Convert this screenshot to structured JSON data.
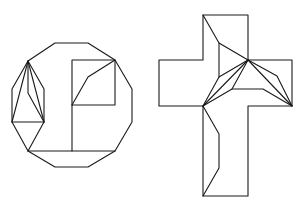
{
  "figure": {
    "background": "#ffffff",
    "stroke_color": "#1a1a1a",
    "shapes": [
      {
        "name": "dodecagon-dissection",
        "outline": [
          [
            55,
            43
          ],
          [
            88,
            43
          ],
          [
            115,
            60
          ],
          [
            132,
            89
          ],
          [
            132,
            122
          ],
          [
            115,
            151
          ],
          [
            88,
            167
          ],
          [
            55,
            167
          ],
          [
            28,
            151
          ],
          [
            12,
            122
          ],
          [
            12,
            89
          ],
          [
            28,
            61
          ]
        ],
        "inner_segments": [
          [
            [
              72,
              60
            ],
            [
              115,
              60
            ],
            [
              115,
              105
            ],
            [
              72,
              105
            ],
            [
              72,
              60
            ]
          ],
          [
            [
              72,
              105
            ],
            [
              72,
              151
            ]
          ],
          [
            [
              72,
              105
            ],
            [
              88,
              77
            ],
            [
              115,
              60
            ]
          ],
          [
            [
              28,
              151
            ],
            [
              115,
              151
            ]
          ],
          [
            [
              28,
              61
            ],
            [
              44,
              89
            ],
            [
              44,
              122
            ],
            [
              28,
              151
            ]
          ],
          [
            [
              12,
              122
            ],
            [
              44,
              122
            ]
          ],
          [
            [
              28,
              61
            ],
            [
              12,
              122
            ]
          ],
          [
            [
              28,
              61
            ],
            [
              44,
              122
            ]
          ],
          [
            [
              28,
              61
            ],
            [
              28,
              93
            ],
            [
              44,
              122
            ]
          ]
        ]
      },
      {
        "name": "cross-dissection",
        "outline": [
          [
            203,
            15
          ],
          [
            248,
            15
          ],
          [
            248,
            60
          ],
          [
            292,
            60
          ],
          [
            292,
            106
          ],
          [
            248,
            106
          ],
          [
            248,
            196
          ],
          [
            203,
            196
          ],
          [
            203,
            106
          ],
          [
            159,
            106
          ],
          [
            159,
            60
          ],
          [
            203,
            60
          ]
        ],
        "inner_segments": [
          [
            [
              203,
              15
            ],
            [
              219,
              43
            ],
            [
              248,
              60
            ]
          ],
          [
            [
              219,
              43
            ],
            [
              219,
              77
            ]
          ],
          [
            [
              248,
              60
            ],
            [
              219,
              77
            ],
            [
              203,
              106
            ]
          ],
          [
            [
              248,
              60
            ],
            [
              203,
              106
            ]
          ],
          [
            [
              248,
              60
            ],
            [
              232,
              89
            ],
            [
              203,
              106
            ]
          ],
          [
            [
              232,
              89
            ],
            [
              263,
              89
            ],
            [
              292,
              106
            ]
          ],
          [
            [
              248,
              60
            ],
            [
              277,
              76
            ],
            [
              292,
              106
            ]
          ],
          [
            [
              248,
              60
            ],
            [
              292,
              106
            ]
          ],
          [
            [
              203,
              106
            ],
            [
              219,
              134
            ],
            [
              219,
              168
            ],
            [
              203,
              196
            ]
          ]
        ]
      }
    ]
  }
}
